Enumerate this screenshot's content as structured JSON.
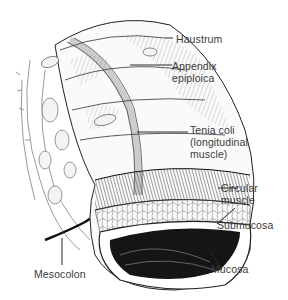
{
  "diagram": {
    "labels": [
      {
        "id": "haustrum",
        "text": "Haustrum"
      },
      {
        "id": "appendix-epiploica",
        "text": "Appendix\nepiploica"
      },
      {
        "id": "tenia-coli",
        "text": "Tenia coli\n(longitudinal\nmuscle)"
      },
      {
        "id": "circular-muscle",
        "text": "Circular\nmuscle"
      },
      {
        "id": "submucosa",
        "text": "Submucosa"
      },
      {
        "id": "mucosa",
        "text": "Mucosa"
      },
      {
        "id": "mesocolon",
        "text": "Mesocolon"
      }
    ],
    "colors": {
      "ink": "#1a1a1a",
      "label_text": "#3a3a3a",
      "leader_line": "#2a2a2a",
      "background": "#ffffff"
    }
  }
}
